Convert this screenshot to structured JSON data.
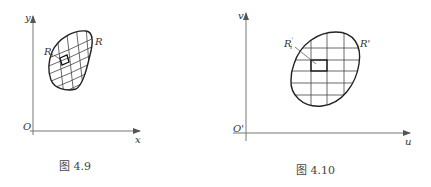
{
  "figures": [
    {
      "id": "fig-4-9",
      "caption": "图 4.9",
      "axes": {
        "x_label": "x",
        "y_label": "y",
        "origin_label": "O"
      },
      "region_label": "R",
      "subregion_label": "R",
      "subregion_subscript": "i"
    },
    {
      "id": "fig-4-10",
      "caption": "图 4.10",
      "axes": {
        "x_label": "u",
        "y_label": "v",
        "origin_label": "O'"
      },
      "region_label": "R'",
      "subregion_label": "R",
      "subregion_subscript": "i",
      "subregion_prime": "'"
    }
  ],
  "colors": {
    "stroke": "#333333",
    "grid": "#555555",
    "axis": "#777777"
  }
}
